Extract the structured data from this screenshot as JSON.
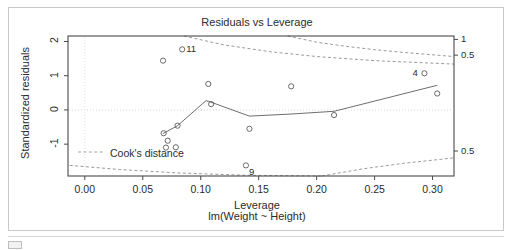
{
  "figure": {
    "title": "Residuals vs Leverage",
    "xlabel_main": "Leverage",
    "xlabel_sub": "lm(Weight ~ Height)",
    "ylabel": "Standardized residuals",
    "legend_label": "Cook's distance"
  },
  "chart_data": {
    "type": "scatter",
    "title": "Residuals vs Leverage",
    "xlabel": "Leverage",
    "xlabel_sub": "lm(Weight ~ Height)",
    "ylabel": "Standardized residuals",
    "xlim": [
      -0.0145,
      0.3185
    ],
    "ylim": [
      -1.93,
      2.16
    ],
    "grid": false,
    "legend_position": "bottom-left",
    "x_ticks": [
      0.0,
      0.05,
      0.1,
      0.15,
      0.2,
      0.25,
      0.3
    ],
    "x_tick_labels": [
      "0.00",
      "0.05",
      "0.10",
      "0.15",
      "0.20",
      "0.25",
      "0.30"
    ],
    "y_ticks": [
      -1,
      0,
      1,
      2
    ],
    "y_tick_labels": [
      "-1",
      "0",
      "1",
      "2"
    ],
    "right_axis_labels": [
      {
        "text": "1",
        "y": 2.06
      },
      {
        "text": "0.5",
        "y": 1.6
      },
      {
        "text": "0.5",
        "y": -1.2
      }
    ],
    "points": [
      {
        "x": 0.0675,
        "y": 1.44,
        "label": ""
      },
      {
        "x": 0.084,
        "y": 1.77,
        "label": "11"
      },
      {
        "x": 0.068,
        "y": -0.68,
        "label": ""
      },
      {
        "x": 0.0715,
        "y": -0.9,
        "label": ""
      },
      {
        "x": 0.07,
        "y": -1.1,
        "label": ""
      },
      {
        "x": 0.0785,
        "y": -1.09,
        "label": ""
      },
      {
        "x": 0.08,
        "y": -0.46,
        "label": ""
      },
      {
        "x": 0.1065,
        "y": 0.76,
        "label": ""
      },
      {
        "x": 0.109,
        "y": 0.17,
        "label": ""
      },
      {
        "x": 0.139,
        "y": -1.62,
        "label": "9"
      },
      {
        "x": 0.142,
        "y": -0.55,
        "label": ""
      },
      {
        "x": 0.178,
        "y": 0.69,
        "label": ""
      },
      {
        "x": 0.215,
        "y": -0.15,
        "label": ""
      },
      {
        "x": 0.293,
        "y": 1.07,
        "label": "4"
      },
      {
        "x": 0.304,
        "y": 0.48,
        "label": ""
      }
    ],
    "loess_line": [
      {
        "x": 0.0675,
        "y": -0.69
      },
      {
        "x": 0.08,
        "y": -0.46
      },
      {
        "x": 0.1045,
        "y": 0.27
      },
      {
        "x": 0.107,
        "y": 0.25
      },
      {
        "x": 0.142,
        "y": -0.18
      },
      {
        "x": 0.178,
        "y": -0.12
      },
      {
        "x": 0.215,
        "y": -0.04
      },
      {
        "x": 0.304,
        "y": 0.72
      }
    ],
    "cooks_contours": [
      {
        "level": 1.0,
        "branch": "upper",
        "points": [
          [
            0.175,
            2.16
          ],
          [
            0.2,
            1.98
          ],
          [
            0.225,
            1.86
          ],
          [
            0.25,
            1.76
          ],
          [
            0.275,
            1.68
          ],
          [
            0.3185,
            1.56
          ]
        ]
      },
      {
        "level": 0.5,
        "branch": "upper",
        "points": [
          [
            0.0855,
            2.16
          ],
          [
            0.12,
            1.9
          ],
          [
            0.16,
            1.7
          ],
          [
            0.2,
            1.56
          ],
          [
            0.25,
            1.44
          ],
          [
            0.3185,
            1.34
          ]
        ]
      },
      {
        "level": 0.5,
        "branch": "lower",
        "points": [
          [
            -0.013,
            -1.62
          ],
          [
            0.03,
            -1.74
          ],
          [
            0.08,
            -1.84
          ],
          [
            0.14,
            -1.91
          ],
          [
            0.2045,
            -1.93
          ]
        ]
      },
      {
        "level": 0.5,
        "branch": "lower-right",
        "points": [
          [
            0.2045,
            -1.93
          ],
          [
            0.24,
            -1.72
          ],
          [
            0.275,
            -1.56
          ],
          [
            0.3185,
            -1.4
          ]
        ]
      }
    ]
  }
}
